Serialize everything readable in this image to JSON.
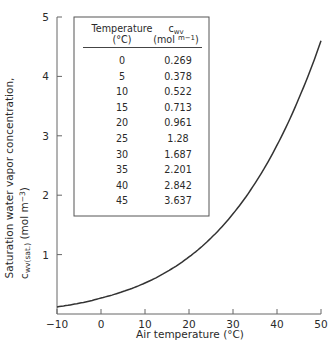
{
  "chart_data": {
    "type": "line",
    "title": "",
    "xlabel": "Air temperature (°C)",
    "ylabel_line1": "Saturation water vapor concentration,",
    "ylabel_line2_main": "c",
    "ylabel_line2_sub": "wv(sat.)",
    "ylabel_line2_unit": " (mol m",
    "ylabel_line2_exp": "−3",
    "ylabel_line2_close": ")",
    "xlim": [
      -10,
      50
    ],
    "ylim": [
      0,
      5
    ],
    "x_ticks": [
      -10,
      0,
      10,
      20,
      30,
      40,
      50
    ],
    "x_tick_labels": [
      "−10",
      "0",
      "10",
      "20",
      "30",
      "40",
      "50"
    ],
    "y_ticks": [
      1,
      2,
      3,
      4,
      5
    ],
    "y_tick_labels": [
      "1",
      "2",
      "3",
      "4",
      "5"
    ],
    "grid": false,
    "series": [
      {
        "name": "Saturation water vapor concentration",
        "x": [
          -10,
          -5,
          0,
          5,
          10,
          15,
          20,
          25,
          30,
          35,
          40,
          45,
          50
        ],
        "values": [
          0.119,
          0.181,
          0.269,
          0.378,
          0.522,
          0.713,
          0.961,
          1.28,
          1.687,
          2.201,
          2.842,
          3.637,
          4.6
        ]
      }
    ],
    "inset_table": {
      "headers": [
        {
          "line1": "Temperature",
          "line2": "(°C)"
        },
        {
          "line1_main": "c",
          "line1_sub": "wv",
          "line2": "(mol ",
          "line2_sup": "m−1",
          "line2_close": ")"
        }
      ],
      "rows": [
        [
          "0",
          "0.269"
        ],
        [
          "5",
          "0.378"
        ],
        [
          "10",
          "0.522"
        ],
        [
          "15",
          "0.713"
        ],
        [
          "20",
          "0.961"
        ],
        [
          "25",
          "1.28"
        ],
        [
          "30",
          "1.687"
        ],
        [
          "35",
          "2.201"
        ],
        [
          "40",
          "2.842"
        ],
        [
          "45",
          "3.637"
        ]
      ]
    }
  }
}
